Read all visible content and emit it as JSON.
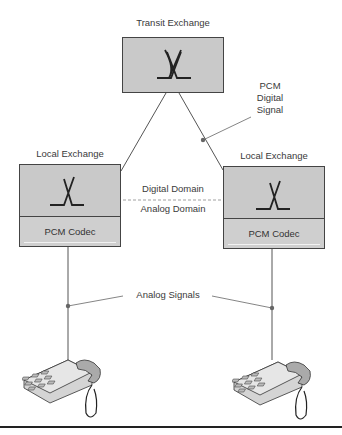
{
  "diagram": {
    "transit": {
      "label": "Transit Exchange"
    },
    "local_left": {
      "label": "Local Exchange",
      "codec": "PCM Codec"
    },
    "local_right": {
      "label": "Local Exchange",
      "codec": "PCM Codec"
    },
    "pcm_signal": {
      "line1": "PCM",
      "line2": "Digital",
      "line3": "Signal"
    },
    "domains": {
      "digital": "Digital Domain",
      "analog": "Analog Domain"
    },
    "analog_signals": "Analog Signals",
    "colors": {
      "box_fill": "#c9c9c9",
      "stroke": "#444444",
      "text": "#3a3a3a"
    }
  }
}
